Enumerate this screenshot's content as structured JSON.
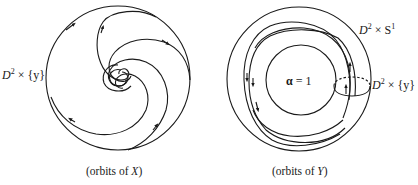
{
  "figure": {
    "left_panel": {
      "caption": "(orbits of X)",
      "caption_prefix": "(orbits of ",
      "caption_var": "X",
      "caption_suffix": ")",
      "label": "D² × {y}",
      "label_base": "D",
      "label_sup": "2",
      "label_rest": " × {y}",
      "description": "Disk with spiral orbits converging to a center point; arrows show flow direction"
    },
    "right_panel": {
      "caption": "(orbits of Y)",
      "caption_prefix": "(orbits of ",
      "caption_var": "Y",
      "caption_suffix": ")",
      "solid_torus_label": "D² × S¹",
      "solid_torus_base": "D",
      "solid_torus_sup1": "2",
      "solid_torus_mid": " × S",
      "solid_torus_sup2": "1",
      "inner_label": "α = 1",
      "inner_label_alpha": "α",
      "inner_label_rest": " = 1",
      "disk_label": "D² × {y}",
      "disk_base": "D",
      "disk_sup": "2",
      "disk_rest": " × {y}",
      "description": "Annulus (solid torus cross-section) with orbits winding around inner circle α=1, meridian disk D²×{y} shown as ellipse"
    },
    "stroke_color": "#1a1a1a",
    "background": "#ffffff"
  }
}
